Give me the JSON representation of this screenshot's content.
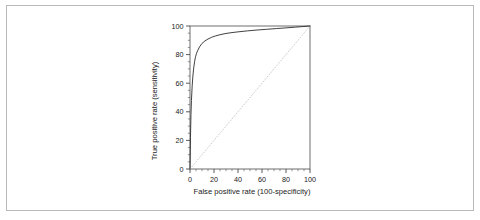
{
  "figure": {
    "background_color": "#ffffff",
    "frame_color": "#b9b9b9"
  },
  "chart_data": {
    "type": "line",
    "title": "",
    "xlabel": "False positive rate (100-specificity)",
    "ylabel": "True positive rate (sensitivity)",
    "xlim": [
      0,
      100
    ],
    "ylim": [
      0,
      100
    ],
    "xticks": [
      0,
      20,
      40,
      60,
      80,
      100
    ],
    "yticks": [
      0,
      20,
      40,
      60,
      80,
      100
    ],
    "xtick_labels": [
      "0",
      "20",
      "40",
      "60",
      "80",
      "100"
    ],
    "ytick_labels": [
      "0",
      "20",
      "40",
      "60",
      "80",
      "100"
    ],
    "minor_tick_step": 5,
    "grid": false,
    "legend": null,
    "series": [
      {
        "name": "ROC curve",
        "style": "solid",
        "color": "#2b2b2b",
        "width": 0.9,
        "x": [
          0,
          0.4,
          0.8,
          1.2,
          1.8,
          2.4,
          3.0,
          3.8,
          4.6,
          5.5,
          6.5,
          8.0,
          10.0,
          12.5,
          15.0,
          18.0,
          21.0,
          25.0,
          30.0,
          35.0,
          40.0,
          48.0,
          56.0,
          64.0,
          72.0,
          80.0,
          88.0,
          94.0,
          100.0
        ],
        "y": [
          0,
          22.0,
          38.0,
          48.0,
          58.0,
          65.0,
          70.0,
          75.0,
          78.5,
          81.0,
          83.0,
          85.5,
          87.8,
          89.6,
          90.9,
          92.1,
          93.0,
          93.9,
          94.8,
          95.4,
          95.9,
          96.6,
          97.2,
          97.7,
          98.2,
          98.7,
          99.2,
          99.6,
          100.0
        ]
      },
      {
        "name": "Reference diagonal",
        "style": "dotted",
        "color": "#c6c6c6",
        "width": 0.9,
        "x": [
          0,
          100
        ],
        "y": [
          0,
          100
        ]
      }
    ]
  }
}
